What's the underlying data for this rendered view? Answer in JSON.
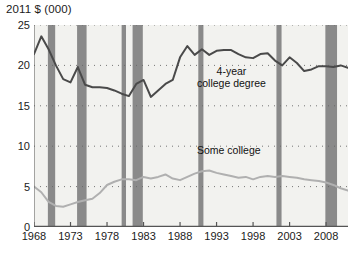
{
  "chart_data": {
    "type": "line",
    "title": "2011 $ (000)",
    "xlabel": "",
    "ylabel": "2011 $ (000)",
    "ylim": [
      0,
      25
    ],
    "xlim": [
      1968,
      2011
    ],
    "yticks": [
      0,
      5,
      10,
      15,
      20,
      25
    ],
    "xticks": [
      1968,
      1973,
      1978,
      1983,
      1988,
      1993,
      1998,
      2003,
      2008
    ],
    "grid": "dotted-horizontal",
    "legend_position": "inline-annotation",
    "colors": {
      "four_year_line": "#4a4a4a",
      "some_college_line": "#b0b0b0",
      "recession_band": "#8a8a8a",
      "plot_background": "#f2f2ef",
      "axis": "#555555",
      "text": "#1b1b1b"
    },
    "annotations": [
      {
        "text": "4-year",
        "x": 1994,
        "y": 19.6
      },
      {
        "text": "college degree",
        "x": 1994,
        "y": 18.3
      },
      {
        "text": "Some college",
        "x": 1994,
        "y": 9.6
      }
    ],
    "series": [
      {
        "name": "4-year college degree",
        "color": "#4a4a4a",
        "x": [
          1968,
          1969,
          1970,
          1971,
          1972,
          1973,
          1974,
          1975,
          1976,
          1977,
          1978,
          1979,
          1980,
          1981,
          1982,
          1983,
          1984,
          1985,
          1986,
          1987,
          1988,
          1989,
          1990,
          1991,
          1992,
          1993,
          1994,
          1995,
          1996,
          1997,
          1998,
          1999,
          2000,
          2001,
          2002,
          2003,
          2004,
          2005,
          2006,
          2007,
          2008,
          2009,
          2010,
          2011
        ],
        "values": [
          21.4,
          23.6,
          22.0,
          20.0,
          18.3,
          17.9,
          19.8,
          17.6,
          17.3,
          17.3,
          17.2,
          16.9,
          16.5,
          16.2,
          17.7,
          18.2,
          16.1,
          16.9,
          17.7,
          18.2,
          21.0,
          22.4,
          21.3,
          22.0,
          21.3,
          21.8,
          21.9,
          21.9,
          21.4,
          21.0,
          20.9,
          21.4,
          21.5,
          20.6,
          20.0,
          21.0,
          20.3,
          19.3,
          19.5,
          19.9,
          19.9,
          19.8,
          20.0,
          19.7
        ]
      },
      {
        "name": "Some college",
        "color": "#b0b0b0",
        "x": [
          1968,
          1969,
          1970,
          1971,
          1972,
          1973,
          1974,
          1975,
          1976,
          1977,
          1978,
          1979,
          1980,
          1981,
          1982,
          1983,
          1984,
          1985,
          1986,
          1987,
          1988,
          1989,
          1990,
          1991,
          1992,
          1993,
          1994,
          1995,
          1996,
          1997,
          1998,
          1999,
          2000,
          2001,
          2002,
          2003,
          2004,
          2005,
          2006,
          2007,
          2008,
          2009,
          2010,
          2011
        ],
        "values": [
          5.0,
          4.3,
          3.1,
          2.6,
          2.5,
          2.8,
          3.1,
          3.3,
          3.5,
          4.2,
          5.2,
          5.6,
          5.9,
          5.9,
          5.8,
          6.2,
          6.0,
          6.2,
          6.5,
          6.0,
          5.8,
          6.2,
          6.6,
          6.9,
          7.0,
          6.7,
          6.5,
          6.3,
          6.1,
          6.2,
          5.9,
          6.2,
          6.3,
          6.2,
          6.3,
          6.2,
          6.1,
          5.9,
          5.8,
          5.7,
          5.5,
          5.2,
          4.8,
          4.5
        ]
      }
    ],
    "recession_bands": [
      {
        "start": 1969.9,
        "end": 1970.9
      },
      {
        "start": 1973.9,
        "end": 1975.2
      },
      {
        "start": 1980.0,
        "end": 1980.6
      },
      {
        "start": 1981.5,
        "end": 1982.9
      },
      {
        "start": 1990.5,
        "end": 1991.2
      },
      {
        "start": 2001.2,
        "end": 2001.9
      },
      {
        "start": 2007.9,
        "end": 2009.5
      }
    ]
  }
}
